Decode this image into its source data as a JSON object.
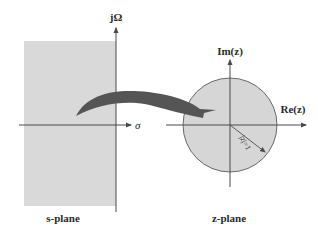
{
  "colors": {
    "background": "#ffffff",
    "s_region_fill": "#d9d9d9",
    "unit_disk_fill": "#d6d6d6",
    "axis": "#4a4a4a",
    "arrow_fill": "#555555",
    "text": "#2b2b2b"
  },
  "s_plane": {
    "caption": "s-plane",
    "vertical_axis_label": "jΩ",
    "horizontal_axis_label": "σ",
    "shaded_region": "left half-plane (σ < 0)"
  },
  "z_plane": {
    "caption": "z-plane",
    "vertical_axis_label": "Im(z)",
    "horizontal_axis_label": "Re(z)",
    "radius_label": "|z|=1",
    "shaded_region": "unit disk"
  },
  "mapping_arrow": {
    "from": "s-plane left half",
    "to": "z-plane unit disk"
  }
}
